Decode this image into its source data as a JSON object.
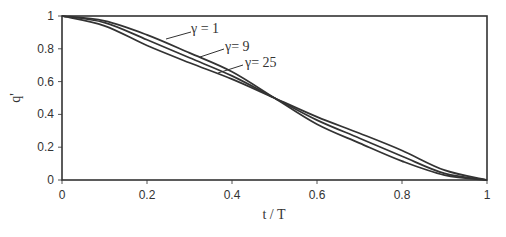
{
  "chart_data": {
    "type": "line",
    "title": "",
    "xlabel": "t / T",
    "ylabel": "q'",
    "xlim": [
      0,
      1
    ],
    "ylim": [
      0,
      1
    ],
    "grid": false,
    "legend_position": "inline-annotations",
    "x_ticks": [
      "0",
      "0.2",
      "0.4",
      "0.6",
      "0.8",
      "1"
    ],
    "y_ticks": [
      "0",
      "0.2",
      "0.4",
      "0.6",
      "0.8",
      "1"
    ],
    "x": [
      0,
      0.1,
      0.2,
      0.3,
      0.4,
      0.5,
      0.6,
      0.7,
      0.8,
      0.9,
      1.0
    ],
    "series": [
      {
        "name": "γ = 1",
        "values": [
          1.0,
          0.97,
          0.885,
          0.775,
          0.66,
          0.5,
          0.34,
          0.225,
          0.115,
          0.03,
          0.0
        ]
      },
      {
        "name": "γ= 9",
        "values": [
          1.0,
          0.96,
          0.855,
          0.745,
          0.635,
          0.5,
          0.365,
          0.255,
          0.145,
          0.04,
          0.0
        ]
      },
      {
        "name": "γ= 25",
        "values": [
          1.0,
          0.94,
          0.82,
          0.715,
          0.615,
          0.5,
          0.385,
          0.285,
          0.18,
          0.06,
          0.0
        ]
      }
    ],
    "annotations": [
      {
        "text": "γ = 1",
        "points_to_series": 0
      },
      {
        "text": "γ= 9",
        "points_to_series": 1
      },
      {
        "text": "γ= 25",
        "points_to_series": 2
      }
    ]
  },
  "colors": {
    "line": "#333333",
    "background": "#ffffff"
  }
}
